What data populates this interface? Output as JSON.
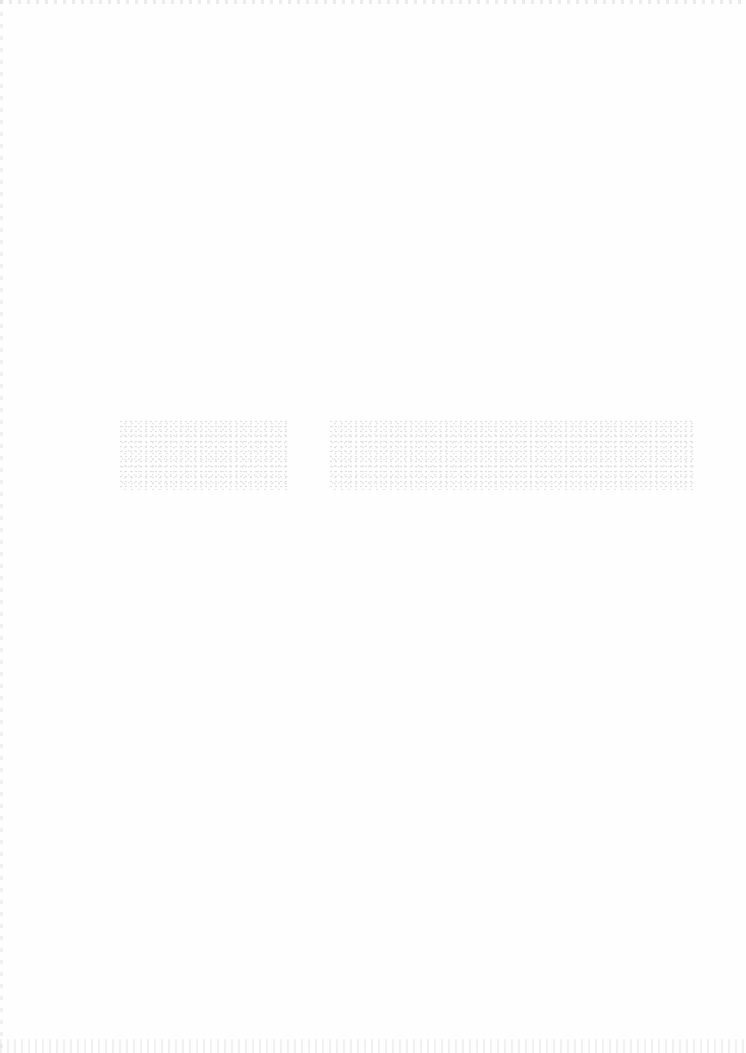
{
  "page": {
    "type": "scanned-page",
    "background_color": "#fefefe",
    "content_state": "nearly-blank"
  },
  "faded_text_band": {
    "legible": false,
    "blocks": [
      {
        "text": "",
        "note": "illegible faded text"
      },
      {
        "text": "",
        "note": "illegible faded text"
      }
    ],
    "ink_color": "#c8c8c8"
  }
}
